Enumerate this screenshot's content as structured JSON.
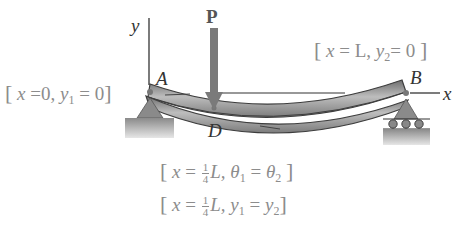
{
  "diagram": {
    "type": "simply-supported beam deflection",
    "axes": {
      "y_label": "y",
      "x_label": "x"
    },
    "load": {
      "label": "P",
      "color": "#7a7a7a"
    },
    "points": {
      "A": "A",
      "B": "B",
      "D": "D"
    },
    "conditions": {
      "left": {
        "bracket_open": "[",
        "x": "x",
        "eq1": "=0,",
        "y": "y",
        "sub": "1",
        "eq2": "= 0",
        "bracket_close": "]"
      },
      "right": {
        "bracket_open": "[",
        "x": "x",
        "eq1": "= L,",
        "y": "y",
        "sub": "2",
        "eq2": "= 0",
        "bracket_close": "]"
      },
      "mid_slope": {
        "bracket_open": "[",
        "x": "x",
        "eq": "=",
        "frac_num": "1",
        "frac_den": "4",
        "L": "L,",
        "theta1": "θ",
        "sub1": "1",
        "eq2": "=",
        "theta2": "θ",
        "sub2": "2",
        "bracket_close": "]"
      },
      "mid_defl": {
        "bracket_open": "[",
        "x": "x",
        "eq": "=",
        "frac_num": "1",
        "frac_den": "4",
        "L": "L,",
        "y1": "y",
        "sub1": "1",
        "eq2": "=",
        "y2": "y",
        "sub2": "2",
        "bracket_close": "]"
      }
    },
    "colors": {
      "beam_dark": "#5a5a5a",
      "beam_light": "#b5b5b5",
      "support": "#8a8a8a",
      "text_gray": "#8c8c8c",
      "text_dark": "#333333"
    }
  }
}
